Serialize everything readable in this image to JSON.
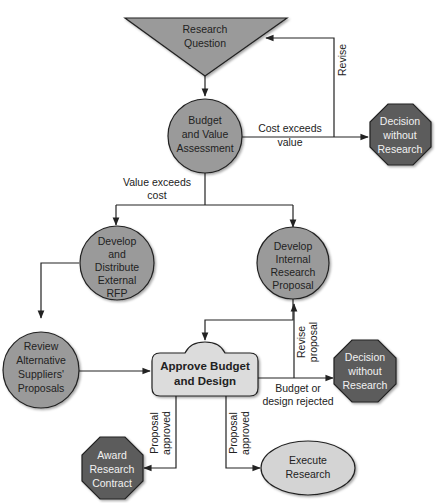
{
  "diagram": {
    "type": "flowchart",
    "colors": {
      "node_fill": "#9a9a9a",
      "decision_fill": "#5c5c5c",
      "approve_fill": "#dcdcdc",
      "execute_fill": "#d4d4d4",
      "line": "#222222"
    },
    "nodes": {
      "research_question": {
        "shape": "inverted-triangle",
        "lines": [
          "Research",
          "Question"
        ]
      },
      "budget_value": {
        "shape": "circle",
        "lines": [
          "Budget",
          "and Value",
          "Assessment"
        ]
      },
      "decision_top": {
        "shape": "octagon",
        "lines": [
          "Decision",
          "without",
          "Research"
        ]
      },
      "external_rfp": {
        "shape": "circle",
        "lines": [
          "Develop",
          "and",
          "Distribute",
          "External",
          "RFP"
        ]
      },
      "internal_proposal": {
        "shape": "circle",
        "lines": [
          "Develop",
          "Internal",
          "Research",
          "Proposal"
        ]
      },
      "review_suppliers": {
        "shape": "circle",
        "lines": [
          "Review",
          "Alternative",
          "Suppliers'",
          "Proposals"
        ]
      },
      "approve": {
        "shape": "rounded-box",
        "lines": [
          "Approve Budget",
          "and Design"
        ]
      },
      "decision_bottom": {
        "shape": "octagon",
        "lines": [
          "Decision",
          "without",
          "Research"
        ]
      },
      "award_contract": {
        "shape": "octagon",
        "lines": [
          "Award",
          "Research",
          "Contract"
        ]
      },
      "execute": {
        "shape": "ellipse",
        "lines": [
          "Execute",
          "Research"
        ]
      }
    },
    "edge_labels": {
      "revise": "Revise",
      "cost_exceeds": [
        "Cost exceeds",
        "value"
      ],
      "value_exceeds": [
        "Value exceeds",
        "cost"
      ],
      "revise_proposal": [
        "Revise",
        "proposal"
      ],
      "budget_rejected": [
        "Budget or",
        "design rejected"
      ],
      "proposal_approved_left": [
        "Proposal",
        "approved"
      ],
      "proposal_approved_right": [
        "Proposal",
        "approved"
      ]
    }
  }
}
